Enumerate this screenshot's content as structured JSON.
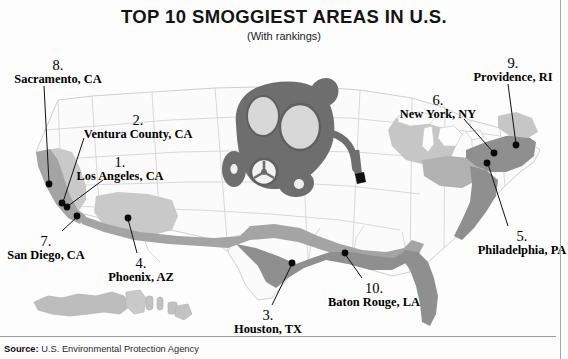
{
  "header": {
    "title": "TOP 10 SMOGGIEST AREAS IN U.S.",
    "subtitle": "(With rankings)"
  },
  "footer": {
    "source_label": "Source:",
    "source_text": "U.S. Environmental Protection Agency"
  },
  "colors": {
    "background": "#fdfdfd",
    "state_outline": "#c9c9c9",
    "map_light": "#d3d3d3",
    "map_medium": "#b4b4b4",
    "map_dark": "#8f8f8f",
    "mask_body": "#6e6e6e",
    "mask_lens": "#d8d8d8",
    "leader_line": "#111111",
    "dot": "#080808",
    "text": "#101010"
  },
  "illustration": {
    "name": "gas-mask",
    "parts": [
      "mask-body",
      "left-lens",
      "right-lens",
      "side-canister",
      "filter-valve",
      "bottom-canister",
      "breathing-hose",
      "hose-tip"
    ]
  },
  "map": {
    "name": "united-states-map",
    "insets": [
      "alaska-inset",
      "hawaii-inset"
    ]
  },
  "callouts": [
    {
      "id": "los-angeles",
      "rank": "1.",
      "place": "Los Angeles, CA",
      "label_x": 120,
      "label_y": 155,
      "align": "center",
      "dot_x": 67,
      "dot_y": 207,
      "line_x1": 103,
      "line_y1": 180,
      "line_x2": 68,
      "line_y2": 206
    },
    {
      "id": "ventura-county",
      "rank": "2.",
      "place": "Ventura County, CA",
      "label_x": 138,
      "label_y": 113,
      "align": "center",
      "dot_x": 62,
      "dot_y": 203,
      "line_x1": 84,
      "line_y1": 138,
      "line_x2": 63,
      "line_y2": 202
    },
    {
      "id": "houston",
      "rank": "3.",
      "place": "Houston, TX",
      "label_x": 268,
      "label_y": 308,
      "align": "center",
      "dot_x": 292,
      "dot_y": 263,
      "line_x1": 272,
      "line_y1": 305,
      "line_x2": 292,
      "line_y2": 264
    },
    {
      "id": "phoenix",
      "rank": "4.",
      "place": "Phoenix, AZ",
      "label_x": 141,
      "label_y": 256,
      "align": "center",
      "dot_x": 128,
      "dot_y": 218,
      "line_x1": 137,
      "line_y1": 253,
      "line_x2": 128,
      "line_y2": 219
    },
    {
      "id": "philadelphia",
      "rank": "5.",
      "place": "Philadelphia, PA",
      "label_x": 522,
      "label_y": 229,
      "align": "center",
      "dot_x": 487,
      "dot_y": 163,
      "line_x1": 508,
      "line_y1": 226,
      "line_x2": 488,
      "line_y2": 164
    },
    {
      "id": "new-york",
      "rank": "6.",
      "place": "New York, NY",
      "label_x": 438,
      "label_y": 93,
      "align": "center",
      "dot_x": 494,
      "dot_y": 153,
      "line_x1": 464,
      "line_y1": 119,
      "line_x2": 493,
      "line_y2": 152
    },
    {
      "id": "san-diego",
      "rank": "7.",
      "place": "San Diego, CA",
      "label_x": 46,
      "label_y": 234,
      "align": "center",
      "dot_x": 77,
      "dot_y": 216,
      "line_x1": 62,
      "line_y1": 231,
      "line_x2": 77,
      "line_y2": 217
    },
    {
      "id": "sacramento",
      "rank": "8.",
      "place": "Sacramento, CA",
      "label_x": 58,
      "label_y": 58,
      "align": "center",
      "dot_x": 49,
      "dot_y": 184,
      "line_x1": 44,
      "line_y1": 86,
      "line_x2": 49,
      "line_y2": 183
    },
    {
      "id": "providence",
      "rank": "9.",
      "place": "Providence, RI",
      "label_x": 513,
      "label_y": 56,
      "align": "center",
      "dot_x": 516,
      "dot_y": 145,
      "line_x1": 508,
      "line_y1": 84,
      "line_x2": 516,
      "line_y2": 144
    },
    {
      "id": "baton-rouge",
      "rank": "10.",
      "place": "Baton Rouge, LA",
      "label_x": 374,
      "label_y": 281,
      "align": "center",
      "dot_x": 345,
      "dot_y": 253,
      "line_x1": 362,
      "line_y1": 278,
      "line_x2": 345,
      "line_y2": 254
    }
  ]
}
